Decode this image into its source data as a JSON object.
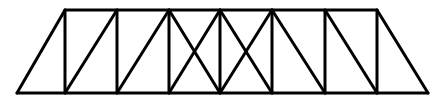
{
  "diagram": {
    "type": "truss",
    "stroke_color": "#000000",
    "background": "#ffffff",
    "stroke_width": 3,
    "nodes": {
      "top": [
        [
          65,
          10
        ],
        [
          117,
          10
        ],
        [
          169,
          10
        ],
        [
          220,
          10
        ],
        [
          272,
          10
        ],
        [
          325,
          10
        ],
        [
          377,
          10
        ]
      ],
      "bottom": [
        [
          17,
          93
        ],
        [
          65,
          93
        ],
        [
          117,
          93
        ],
        [
          169,
          93
        ],
        [
          220,
          93
        ],
        [
          272,
          93
        ],
        [
          325,
          93
        ],
        [
          377,
          93
        ],
        [
          428,
          93
        ]
      ]
    },
    "members": [
      {
        "name": "top-chord",
        "x1": 65,
        "y1": 10,
        "x2": 377,
        "y2": 10
      },
      {
        "name": "bottom-chord",
        "x1": 17,
        "y1": 93,
        "x2": 428,
        "y2": 93
      },
      {
        "name": "left-end-post",
        "x1": 17,
        "y1": 93,
        "x2": 65,
        "y2": 10
      },
      {
        "name": "right-end-post",
        "x1": 377,
        "y1": 10,
        "x2": 428,
        "y2": 93
      },
      {
        "name": "vertical-1",
        "x1": 65,
        "y1": 10,
        "x2": 65,
        "y2": 93
      },
      {
        "name": "vertical-2",
        "x1": 117,
        "y1": 10,
        "x2": 117,
        "y2": 93
      },
      {
        "name": "vertical-3",
        "x1": 169,
        "y1": 10,
        "x2": 169,
        "y2": 93
      },
      {
        "name": "vertical-4",
        "x1": 220,
        "y1": 10,
        "x2": 220,
        "y2": 93
      },
      {
        "name": "vertical-5",
        "x1": 272,
        "y1": 10,
        "x2": 272,
        "y2": 93
      },
      {
        "name": "vertical-6",
        "x1": 325,
        "y1": 10,
        "x2": 325,
        "y2": 93
      },
      {
        "name": "vertical-7",
        "x1": 377,
        "y1": 10,
        "x2": 377,
        "y2": 93
      },
      {
        "name": "diagonal-bay-2",
        "x1": 65,
        "y1": 93,
        "x2": 117,
        "y2": 10
      },
      {
        "name": "diagonal-bay-3",
        "x1": 117,
        "y1": 93,
        "x2": 169,
        "y2": 10
      },
      {
        "name": "diagonal-bay-4a",
        "x1": 169,
        "y1": 10,
        "x2": 220,
        "y2": 93
      },
      {
        "name": "diagonal-bay-4b",
        "x1": 169,
        "y1": 93,
        "x2": 220,
        "y2": 10
      },
      {
        "name": "diagonal-bay-5a",
        "x1": 220,
        "y1": 10,
        "x2": 272,
        "y2": 93
      },
      {
        "name": "diagonal-bay-5b",
        "x1": 220,
        "y1": 93,
        "x2": 272,
        "y2": 10
      },
      {
        "name": "diagonal-bay-6",
        "x1": 272,
        "y1": 10,
        "x2": 325,
        "y2": 93
      },
      {
        "name": "diagonal-bay-7",
        "x1": 325,
        "y1": 10,
        "x2": 377,
        "y2": 93
      }
    ]
  }
}
